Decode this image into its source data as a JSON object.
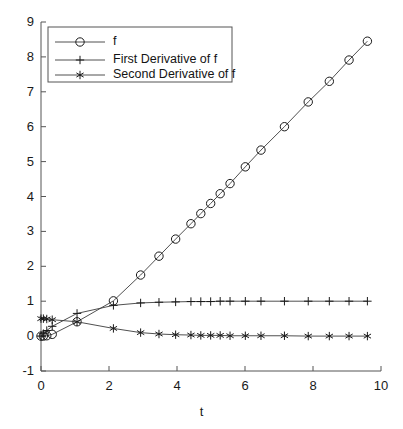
{
  "chart_data": {
    "type": "line",
    "title": "",
    "xlabel": "t",
    "ylabel": "",
    "xlim": [
      0,
      10
    ],
    "ylim": [
      -1,
      9
    ],
    "xticks": [
      0,
      2,
      4,
      6,
      8,
      10
    ],
    "xtick_labels": [
      "0",
      "2",
      "4",
      "6",
      "8",
      "10"
    ],
    "yticks": [
      -1,
      0,
      1,
      2,
      3,
      4,
      5,
      6,
      7,
      8,
      9
    ],
    "ytick_labels": [
      "-1",
      "0",
      "1",
      "2",
      "3",
      "4",
      "5",
      "6",
      "7",
      "8",
      "9"
    ],
    "grid": false,
    "legend_position": "upper left",
    "line_color": "#3c3c3c",
    "marker_color": "#1a1a1a",
    "background_color": "#ffffff",
    "series": [
      {
        "name": "f",
        "marker": "circle",
        "x": [
          0.0,
          0.07,
          0.17,
          0.33,
          1.06,
          2.13,
          2.93,
          3.47,
          3.96,
          4.41,
          4.7,
          4.99,
          5.27,
          5.56,
          6.01,
          6.47,
          7.16,
          7.86,
          8.48,
          9.06,
          9.6
        ],
        "y": [
          0.0,
          0.0,
          0.01,
          0.05,
          0.41,
          1.01,
          1.75,
          2.29,
          2.78,
          3.22,
          3.51,
          3.8,
          4.08,
          4.37,
          4.85,
          5.33,
          6.0,
          6.71,
          7.3,
          7.91,
          8.45
        ]
      },
      {
        "name": "First Derivative of f",
        "marker": "plus",
        "x": [
          0.0,
          0.07,
          0.17,
          0.33,
          1.06,
          2.13,
          2.93,
          3.47,
          3.96,
          4.41,
          4.7,
          4.99,
          5.27,
          5.56,
          6.01,
          6.47,
          7.16,
          7.86,
          8.48,
          9.06,
          9.6
        ],
        "y": [
          0.0,
          0.07,
          0.16,
          0.28,
          0.65,
          0.88,
          0.95,
          0.97,
          0.98,
          0.99,
          0.99,
          0.99,
          1.0,
          1.0,
          1.0,
          1.0,
          1.0,
          1.0,
          1.0,
          1.0,
          1.0
        ]
      },
      {
        "name": "Second Derivative of f",
        "marker": "star",
        "x": [
          0.0,
          0.07,
          0.17,
          0.33,
          1.06,
          2.13,
          2.93,
          3.47,
          3.96,
          4.41,
          4.7,
          4.99,
          5.27,
          5.56,
          6.01,
          6.47,
          7.16,
          7.86,
          8.48,
          9.06,
          9.6
        ],
        "y": [
          0.5,
          0.5,
          0.49,
          0.47,
          0.41,
          0.22,
          0.1,
          0.06,
          0.04,
          0.03,
          0.02,
          0.02,
          0.02,
          0.01,
          0.01,
          0.01,
          0.01,
          0.0,
          0.0,
          0.0,
          0.0
        ]
      }
    ]
  },
  "legend": {
    "entries": [
      {
        "label": "f",
        "marker": "circle"
      },
      {
        "label": "First Derivative of f",
        "marker": "plus"
      },
      {
        "label": "Second Derivative of f",
        "marker": "star"
      }
    ]
  },
  "axes": {
    "x_axis_title": "t"
  }
}
